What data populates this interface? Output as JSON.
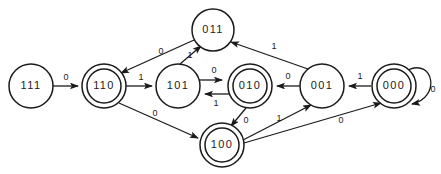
{
  "diagram": {
    "type": "finite-state-machine",
    "background_color": "#ffffff",
    "stroke_color": "#1b1b1b",
    "states": [
      {
        "id": "s111",
        "label": "111",
        "accepting": false,
        "cx": 31,
        "cy": 86,
        "r": 22
      },
      {
        "id": "s110",
        "label": "110",
        "accepting": true,
        "cx": 104,
        "cy": 86,
        "r": 22
      },
      {
        "id": "s101",
        "label": "101",
        "accepting": false,
        "cx": 178,
        "cy": 86,
        "r": 22
      },
      {
        "id": "s010",
        "label": "010",
        "accepting": true,
        "cx": 250,
        "cy": 86,
        "r": 22
      },
      {
        "id": "s001",
        "label": "001",
        "accepting": false,
        "cx": 322,
        "cy": 86,
        "r": 22
      },
      {
        "id": "s000",
        "label": "000",
        "accepting": true,
        "cx": 394,
        "cy": 86,
        "r": 22
      },
      {
        "id": "s011",
        "label": "011",
        "accepting": false,
        "cx": 213,
        "cy": 30,
        "r": 21
      },
      {
        "id": "s100",
        "label": "100",
        "accepting": true,
        "cx": 222,
        "cy": 145,
        "r": 22
      }
    ],
    "transitions": [
      {
        "from": "s111",
        "to": "s110",
        "label": "0",
        "label_x": 66,
        "label_y": 78
      },
      {
        "from": "s110",
        "to": "s101",
        "label": "1",
        "label_x": 141,
        "label_y": 78
      },
      {
        "from": "s101",
        "to": "s010",
        "label": "0",
        "label_x": 214,
        "label_y": 72
      },
      {
        "from": "s010",
        "to": "s101",
        "label": "1",
        "label_x": 214,
        "label_y": 103
      },
      {
        "from": "s001",
        "to": "s010",
        "label": "0",
        "label_x": 287,
        "label_y": 78
      },
      {
        "from": "s000",
        "to": "s001",
        "label": "1",
        "label_x": 358,
        "label_y": 78
      },
      {
        "from": "s000",
        "to": "s000",
        "label": "0",
        "label_x": 432,
        "label_y": 90
      },
      {
        "from": "s011",
        "to": "s110",
        "label": "0",
        "label_x": 160,
        "label_y": 54
      },
      {
        "from": "s101",
        "to": "s011",
        "label": "1",
        "label_x": 190,
        "label_y": 55
      },
      {
        "from": "s001",
        "to": "s011",
        "label": "1",
        "label_x": 270,
        "label_y": 48
      },
      {
        "from": "s110",
        "to": "s100",
        "label": "0",
        "label_x": 155,
        "label_y": 120
      },
      {
        "from": "s010",
        "to": "s100",
        "label": "0",
        "label_x": 243,
        "label_y": 122
      },
      {
        "from": "s100",
        "to": "s001",
        "label": "1",
        "label_x": 280,
        "label_y": 122
      },
      {
        "from": "s100",
        "to": "s000",
        "label": "0",
        "label_x": 340,
        "label_y": 122
      }
    ]
  }
}
